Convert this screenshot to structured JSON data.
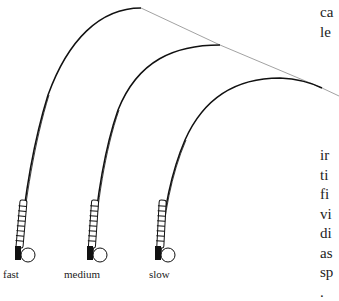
{
  "diagram": {
    "rods": [
      {
        "label": "fast"
      },
      {
        "label": "medium"
      },
      {
        "label": "slow"
      }
    ]
  },
  "side_text": {
    "top_lines": [
      "ca",
      "le"
    ],
    "bottom_lines": [
      "ir",
      "ti",
      "fi",
      "vi",
      "di",
      "as",
      "sp",
      "."
    ]
  },
  "colors": {
    "rod": "#111111",
    "line": "#888888",
    "text": "#222222"
  }
}
